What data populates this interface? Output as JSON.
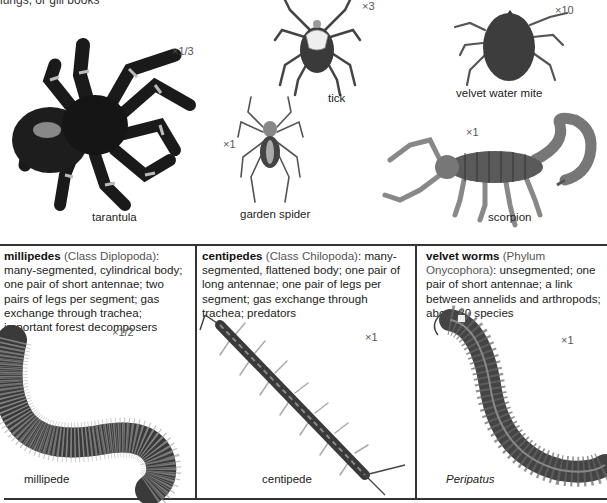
{
  "page": {
    "cut_off_text": "lungs, or gill books"
  },
  "arachnids": [
    {
      "name": "tarantula",
      "scale": "×1/3"
    },
    {
      "name": "tick",
      "scale": "×3"
    },
    {
      "name": "velvet water mite",
      "scale": "×10"
    },
    {
      "name": "garden spider",
      "scale": "×1"
    },
    {
      "name": "scorpion",
      "scale": "×1"
    }
  ],
  "panels": [
    {
      "title": "millipedes",
      "classification": "(Class Diplopoda)",
      "description": ": many-segmented, cylindrical body; one pair of short antennae; two pairs of legs per segment; gas exchange through trachea; important forest decomposers",
      "specimen_label": "millipede",
      "scale": "×1/2"
    },
    {
      "title": "centipedes",
      "classification": "(Class Chilopoda)",
      "description": ": many-segmented, flattened body; one pair of long antennae; one pair of legs per segment; gas exchange through trachea; predators",
      "specimen_label": "centipede",
      "scale": "×1"
    },
    {
      "title": "velvet worms",
      "classification": "(Phylum Onycophora)",
      "description": ": unsegmented; one pair of short antennae; a link between annelids and arthropods; about 80 species",
      "specimen_label": "Peripatus",
      "scale": "×1"
    }
  ]
}
